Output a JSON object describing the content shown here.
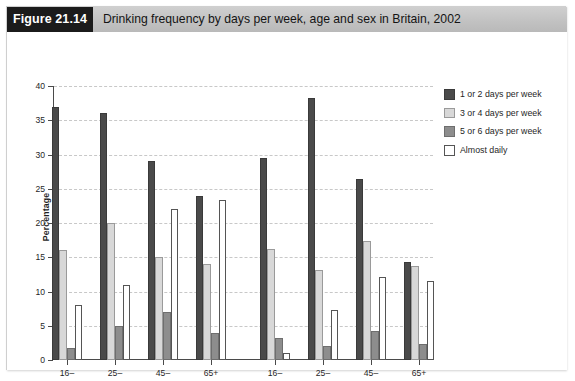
{
  "figure": {
    "tag": "Figure 21.14",
    "title": "Drinking frequency by days per week, age and sex in Britain, 2002"
  },
  "chart_data": {
    "type": "bar",
    "title": "Drinking frequency by days per week, age and sex in Britain, 2002",
    "xlabel": "",
    "ylabel": "Percentage",
    "ylim": [
      0,
      40
    ],
    "yticks": [
      0,
      5,
      10,
      15,
      20,
      25,
      30,
      35,
      40
    ],
    "grid": true,
    "legend_position": "right",
    "categories": [
      "16–",
      "25–",
      "45–",
      "65+",
      "16–",
      "25–",
      "45–",
      "65+"
    ],
    "group_labels": [
      "Males",
      "Females"
    ],
    "series": [
      {
        "name": "1 or 2 days per week",
        "color": "#4a4a4a",
        "values": [
          37.0,
          36.0,
          29.0,
          24.0,
          29.5,
          38.3,
          26.4,
          14.3
        ]
      },
      {
        "name": "3 or 4 days per week",
        "color": "#d8d8d8",
        "values": [
          16.0,
          20.0,
          15.0,
          14.0,
          16.2,
          13.2,
          17.4,
          13.7
        ]
      },
      {
        "name": "5 or 6 days per week",
        "color": "#8d8d8d",
        "values": [
          1.8,
          5.0,
          7.0,
          4.0,
          3.2,
          2.0,
          4.3,
          2.3
        ]
      },
      {
        "name": "Almost daily",
        "color": "#ffffff",
        "values": [
          8.0,
          11.0,
          22.0,
          23.3,
          1.0,
          7.3,
          12.1,
          11.5
        ]
      }
    ]
  }
}
